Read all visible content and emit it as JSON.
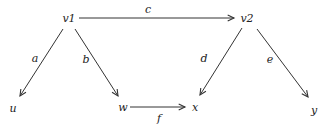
{
  "diagram": {
    "type": "directed-graph",
    "nodes": [
      {
        "id": "v1",
        "label": "v1",
        "x": 69,
        "y": 18
      },
      {
        "id": "v2",
        "label": "v2",
        "x": 247,
        "y": 18
      },
      {
        "id": "u",
        "label": "u",
        "x": 13,
        "y": 108
      },
      {
        "id": "w",
        "label": "w",
        "x": 123,
        "y": 107
      },
      {
        "id": "x",
        "label": "x",
        "x": 195,
        "y": 107
      },
      {
        "id": "y",
        "label": "y",
        "x": 314,
        "y": 110
      }
    ],
    "edges": [
      {
        "id": "c",
        "label": "c",
        "from": "v1",
        "to": "v2",
        "x1": 79,
        "y1": 18,
        "x2": 234,
        "y2": 18,
        "lx": 148,
        "ly": 9
      },
      {
        "id": "a",
        "label": "a",
        "from": "v1",
        "to": "u",
        "x1": 63,
        "y1": 29,
        "x2": 20,
        "y2": 96,
        "lx": 35,
        "ly": 58
      },
      {
        "id": "b",
        "label": "b",
        "from": "v1",
        "to": "w",
        "x1": 75,
        "y1": 29,
        "x2": 118,
        "y2": 96,
        "lx": 86,
        "ly": 59
      },
      {
        "id": "d",
        "label": "d",
        "from": "v2",
        "to": "x",
        "x1": 242,
        "y1": 28,
        "x2": 200,
        "y2": 95,
        "lx": 204,
        "ly": 58
      },
      {
        "id": "e",
        "label": "e",
        "from": "v2",
        "to": "y",
        "x1": 257,
        "y1": 29,
        "x2": 308,
        "y2": 97,
        "lx": 270,
        "ly": 59
      },
      {
        "id": "f",
        "label": "f",
        "from": "w",
        "to": "x",
        "x1": 130,
        "y1": 107,
        "x2": 185,
        "y2": 107,
        "lx": 159,
        "ly": 118
      }
    ],
    "colors": {
      "stroke": "#333333",
      "text": "#222222",
      "background": "#ffffff"
    }
  }
}
